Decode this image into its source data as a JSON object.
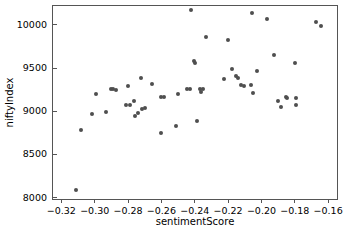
{
  "chart_data": {
    "type": "scatter",
    "title": "",
    "xlabel": "sentimentScore",
    "ylabel": "niftyIndex",
    "xlim": [
      -0.325,
      -0.1535
    ],
    "ylim": [
      7960,
      10220
    ],
    "xticks": [
      -0.32,
      -0.3,
      -0.28,
      -0.26,
      -0.24,
      -0.22,
      -0.2,
      -0.18,
      -0.16
    ],
    "xticklabels": [
      "−0.32",
      "−0.30",
      "−0.28",
      "−0.26",
      "−0.24",
      "−0.22",
      "−0.20",
      "−0.18",
      "−0.16"
    ],
    "yticks": [
      8000,
      8500,
      9000,
      9500,
      10000
    ],
    "yticklabels": [
      "8000",
      "8500",
      "9000",
      "9500",
      "10000"
    ],
    "grid": false,
    "legend": false,
    "marker": "circle",
    "marker_color": "#4f4f4f",
    "marker_size": 4,
    "points": [
      {
        "x": -0.3115,
        "y": 8090
      },
      {
        "x": -0.3085,
        "y": 8785
      },
      {
        "x": -0.3015,
        "y": 8970
      },
      {
        "x": -0.2995,
        "y": 9195
      },
      {
        "x": -0.293,
        "y": 8990
      },
      {
        "x": -0.2905,
        "y": 9255
      },
      {
        "x": -0.289,
        "y": 9260
      },
      {
        "x": -0.2875,
        "y": 9250
      },
      {
        "x": -0.2815,
        "y": 9075
      },
      {
        "x": -0.28,
        "y": 9290
      },
      {
        "x": -0.279,
        "y": 9070
      },
      {
        "x": -0.2765,
        "y": 9115
      },
      {
        "x": -0.276,
        "y": 8940
      },
      {
        "x": -0.274,
        "y": 8985
      },
      {
        "x": -0.2725,
        "y": 9385
      },
      {
        "x": -0.2715,
        "y": 9030
      },
      {
        "x": -0.27,
        "y": 9035
      },
      {
        "x": -0.2655,
        "y": 9320
      },
      {
        "x": -0.2605,
        "y": 8750
      },
      {
        "x": -0.26,
        "y": 9170
      },
      {
        "x": -0.2585,
        "y": 9165
      },
      {
        "x": -0.2515,
        "y": 8825
      },
      {
        "x": -0.25,
        "y": 9205
      },
      {
        "x": -0.2445,
        "y": 9255
      },
      {
        "x": -0.243,
        "y": 9260
      },
      {
        "x": -0.242,
        "y": 10170
      },
      {
        "x": -0.2405,
        "y": 9580
      },
      {
        "x": -0.24,
        "y": 9555
      },
      {
        "x": -0.2385,
        "y": 8885
      },
      {
        "x": -0.237,
        "y": 9260
      },
      {
        "x": -0.236,
        "y": 9225
      },
      {
        "x": -0.235,
        "y": 9255
      },
      {
        "x": -0.2335,
        "y": 9865
      },
      {
        "x": -0.2225,
        "y": 9370
      },
      {
        "x": -0.22,
        "y": 9830
      },
      {
        "x": -0.2175,
        "y": 9495
      },
      {
        "x": -0.215,
        "y": 9405
      },
      {
        "x": -0.214,
        "y": 9385
      },
      {
        "x": -0.2125,
        "y": 9305
      },
      {
        "x": -0.2105,
        "y": 9290
      },
      {
        "x": -0.2065,
        "y": 9305
      },
      {
        "x": -0.2055,
        "y": 10135
      },
      {
        "x": -0.205,
        "y": 9215
      },
      {
        "x": -0.2025,
        "y": 9465
      },
      {
        "x": -0.1965,
        "y": 10065
      },
      {
        "x": -0.1925,
        "y": 9650
      },
      {
        "x": -0.19,
        "y": 9115
      },
      {
        "x": -0.188,
        "y": 9055
      },
      {
        "x": -0.1855,
        "y": 9160
      },
      {
        "x": -0.1845,
        "y": 9155
      },
      {
        "x": -0.18,
        "y": 9555
      },
      {
        "x": -0.1795,
        "y": 9150
      },
      {
        "x": -0.179,
        "y": 9075
      },
      {
        "x": -0.167,
        "y": 10035
      },
      {
        "x": -0.164,
        "y": 9985
      }
    ]
  }
}
